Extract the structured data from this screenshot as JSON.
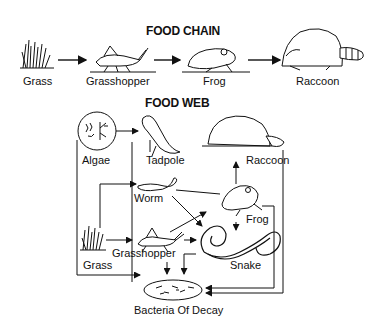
{
  "food_chain": {
    "title": "FOOD CHAIN",
    "nodes": [
      {
        "id": "grass",
        "label": "Grass"
      },
      {
        "id": "grasshopper",
        "label": "Grasshopper"
      },
      {
        "id": "frog",
        "label": "Frog"
      },
      {
        "id": "raccoon",
        "label": "Raccoon"
      }
    ],
    "edges": [
      [
        "grass",
        "grasshopper"
      ],
      [
        "grasshopper",
        "frog"
      ],
      [
        "frog",
        "raccoon"
      ]
    ]
  },
  "food_web": {
    "title": "FOOD WEB",
    "nodes": [
      {
        "id": "algae",
        "label": "Algae"
      },
      {
        "id": "tadpole",
        "label": "Tadpole"
      },
      {
        "id": "raccoon",
        "label": "Raccoon"
      },
      {
        "id": "worm",
        "label": "Worm"
      },
      {
        "id": "frog",
        "label": "Frog"
      },
      {
        "id": "grass",
        "label": "Grass"
      },
      {
        "id": "grasshopper",
        "label": "Grasshopper"
      },
      {
        "id": "snake",
        "label": "Snake"
      },
      {
        "id": "bacteria",
        "label": "Bacteria Of Decay"
      }
    ],
    "edges": [
      [
        "algae",
        "tadpole"
      ],
      [
        "frog",
        "raccoon"
      ],
      [
        "grass",
        "worm"
      ],
      [
        "grass",
        "grasshopper"
      ],
      [
        "worm",
        "snake"
      ],
      [
        "worm",
        "frog"
      ],
      [
        "grasshopper",
        "frog"
      ],
      [
        "grasshopper",
        "snake"
      ],
      [
        "frog",
        "snake"
      ],
      [
        "algae",
        "bacteria"
      ],
      [
        "grass",
        "bacteria"
      ],
      [
        "tadpole",
        "bacteria"
      ],
      [
        "grasshopper",
        "bacteria"
      ],
      [
        "snake",
        "bacteria"
      ],
      [
        "frog",
        "bacteria"
      ],
      [
        "raccoon",
        "bacteria"
      ]
    ]
  }
}
